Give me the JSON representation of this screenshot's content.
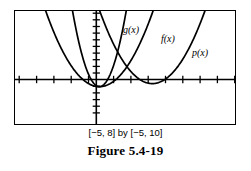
{
  "figure": {
    "caption": "Figure 5.4-19",
    "window_caption": "[−5, 8] by [−5, 10]",
    "labels": {
      "g": "g(x)",
      "f": "f(x)",
      "p": "p(x)"
    }
  },
  "chart_data": {
    "type": "line",
    "title": "Figure 5.4-19",
    "subtitle": "[−5, 8] by [−5, 10]",
    "xlabel": "",
    "ylabel": "",
    "xlim": [
      -5,
      8
    ],
    "ylim": [
      -5,
      10
    ],
    "xtick_step": 1,
    "ytick_step": 1,
    "grid": false,
    "legend": "inline-curve-labels",
    "axis_style": "graphing-calculator-frame-with-tick-marks",
    "curve_color": "#000000",
    "axis_color": "#000000",
    "background": "#ffffff",
    "series": [
      {
        "name": "g(x)",
        "label": "g(x)",
        "description": "narrow upward parabola, vertex at origin",
        "vertex": [
          0,
          0
        ],
        "leading_coefficient": 4,
        "equation": "g(x) = 4x^2",
        "points": [
          [
            -1.6,
            10.24
          ],
          [
            -1.4,
            7.84
          ],
          [
            -1.2,
            5.76
          ],
          [
            -1.0,
            4.0
          ],
          [
            -0.8,
            2.56
          ],
          [
            -0.6,
            1.44
          ],
          [
            -0.4,
            0.64
          ],
          [
            -0.2,
            0.16
          ],
          [
            0,
            0
          ],
          [
            0.2,
            0.16
          ],
          [
            0.4,
            0.64
          ],
          [
            0.6,
            1.44
          ],
          [
            0.8,
            2.56
          ],
          [
            1.0,
            4.0
          ],
          [
            1.2,
            5.76
          ],
          [
            1.4,
            7.84
          ],
          [
            1.6,
            10.24
          ]
        ]
      },
      {
        "name": "f(x)",
        "label": "f(x)",
        "description": "standard upward parabola, vertex at origin, wider than g",
        "vertex": [
          0,
          0
        ],
        "leading_coefficient": 1,
        "equation": "f(x) = x^2",
        "points": [
          [
            -3.2,
            10.24
          ],
          [
            -3.0,
            9.0
          ],
          [
            -2.5,
            6.25
          ],
          [
            -2.0,
            4.0
          ],
          [
            -1.5,
            2.25
          ],
          [
            -1.0,
            1.0
          ],
          [
            -0.5,
            0.25
          ],
          [
            0,
            0
          ],
          [
            0.5,
            0.25
          ],
          [
            1.0,
            1.0
          ],
          [
            1.5,
            2.25
          ],
          [
            2.0,
            4.0
          ],
          [
            2.5,
            6.25
          ],
          [
            3.0,
            9.0
          ],
          [
            3.2,
            10.24
          ]
        ]
      },
      {
        "name": "p(x)",
        "label": "p(x)",
        "description": "upward parabola shifted right, vertex near x = 3",
        "vertex": [
          3.1,
          0.4
        ],
        "leading_coefficient": 1,
        "equation": "p(x) = (x − 3)^2",
        "points": [
          [
            -0.05,
            10.0
          ],
          [
            0.3,
            8.2
          ],
          [
            0.8,
            5.7
          ],
          [
            1.3,
            3.6
          ],
          [
            1.8,
            2.1
          ],
          [
            2.3,
            1.0
          ],
          [
            2.8,
            0.45
          ],
          [
            3.1,
            0.4
          ],
          [
            3.5,
            0.6
          ],
          [
            4.0,
            1.2
          ],
          [
            4.5,
            2.4
          ],
          [
            5.0,
            4.0
          ],
          [
            5.5,
            6.1
          ],
          [
            6.0,
            8.6
          ],
          [
            6.35,
            10.5
          ]
        ]
      }
    ]
  }
}
